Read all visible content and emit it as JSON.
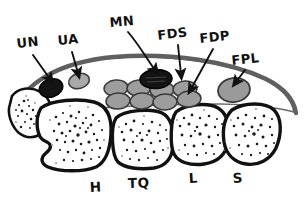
{
  "figure": {
    "background_color": "#ffffff",
    "ink_color": "#111111"
  },
  "labels": {
    "structures": [
      {
        "id": "UN",
        "text": "UN",
        "x": 24,
        "y": 45,
        "target_x": 51,
        "target_y": 85,
        "color": "#141414"
      },
      {
        "id": "UA",
        "text": "UA",
        "x": 63,
        "y": 42,
        "target_x": 78,
        "target_y": 80,
        "color": "#a9a9a9"
      },
      {
        "id": "MN",
        "text": "MN",
        "x": 113,
        "y": 22,
        "target_x": 155,
        "target_y": 74,
        "color": "#141414"
      },
      {
        "id": "FDS",
        "text": "FDS",
        "x": 163,
        "y": 36,
        "target_x": 180,
        "target_y": 78,
        "color": "#9d9d9d"
      },
      {
        "id": "FDP",
        "text": "FDP",
        "x": 205,
        "y": 40,
        "target_x": 190,
        "target_y": 92,
        "color": "#9d9d9d"
      },
      {
        "id": "FPL",
        "text": "FPL",
        "x": 237,
        "y": 62,
        "target_x": 236,
        "target_y": 85,
        "color": "#9a9a9a"
      }
    ],
    "bones": [
      {
        "id": "H",
        "text": "H",
        "x": 96,
        "y": 190
      },
      {
        "id": "TQ",
        "text": "TQ",
        "x": 136,
        "y": 186
      },
      {
        "id": "L",
        "text": "L",
        "x": 194,
        "y": 181
      },
      {
        "id": "S",
        "text": "S",
        "x": 238,
        "y": 181
      }
    ]
  },
  "legend_meaning": {
    "UN": "Ulnar nerve",
    "UA": "Ulnar artery",
    "MN": "Median nerve",
    "FDS": "Flexor digitorum superficialis tendons",
    "FDP": "Flexor digitorum profundus tendons",
    "FPL": "Flexor pollicis longus tendon",
    "H": "Hamate",
    "TQ": "Triquetrum",
    "L": "Lunate",
    "S": "Scaphoid"
  },
  "structures": {
    "retinaculum": {
      "name": "flexor-retinaculum",
      "color": "#5f5f5f",
      "thickness": 4.4
    },
    "nerves": [
      {
        "id": "UN",
        "cx": 51,
        "cy": 88,
        "rx": 12,
        "ry": 9,
        "rot": -18,
        "fill": "#141414"
      },
      {
        "id": "MN",
        "cx": 156,
        "cy": 79,
        "rx": 16,
        "ry": 9.5,
        "rot": -3,
        "fill": "#141414"
      }
    ],
    "arteries": [
      {
        "id": "UA",
        "cx": 79,
        "cy": 81,
        "rx": 10.5,
        "ry": 7.5,
        "rot": -14,
        "fill": "#a9a9a9"
      }
    ],
    "tendons_row_top": [
      {
        "cx": 116,
        "cy": 88,
        "rx": 12,
        "ry": 8,
        "rot": -6
      },
      {
        "cx": 139,
        "cy": 88,
        "rx": 12,
        "ry": 8,
        "rot": -4
      },
      {
        "cx": 162,
        "cy": 90,
        "rx": 12,
        "ry": 8,
        "rot": -3
      },
      {
        "cx": 185,
        "cy": 89,
        "rx": 12,
        "ry": 8,
        "rot": -4
      }
    ],
    "tendons_row_bottom": [
      {
        "cx": 118,
        "cy": 101,
        "rx": 12,
        "ry": 8,
        "rot": -4
      },
      {
        "cx": 142,
        "cy": 101,
        "rx": 12,
        "ry": 8,
        "rot": -3
      },
      {
        "cx": 165,
        "cy": 102,
        "rx": 12,
        "ry": 8,
        "rot": -2
      },
      {
        "cx": 189,
        "cy": 99,
        "rx": 12,
        "ry": 8,
        "rot": -6
      }
    ],
    "fpl": {
      "cx": 234,
      "cy": 90,
      "rx": 16,
      "ry": 12,
      "rot": -8,
      "fill": "#9a9a9a"
    },
    "bones": [
      {
        "id": "pisiform-like",
        "label": "",
        "cx": 32,
        "cy": 116
      },
      {
        "id": "H",
        "label": "H",
        "cx": 72,
        "cy": 137
      },
      {
        "id": "TQ",
        "label": "TQ",
        "cx": 137,
        "cy": 136
      },
      {
        "id": "L",
        "label": "L",
        "cx": 193,
        "cy": 133
      },
      {
        "id": "S",
        "label": "S",
        "cx": 248,
        "cy": 132
      }
    ]
  },
  "counts": {
    "tendon_ellipses": 8,
    "tendon_rows": 2,
    "tendons_per_row": 4,
    "labeled_structures": 6,
    "labeled_bones": 4
  }
}
